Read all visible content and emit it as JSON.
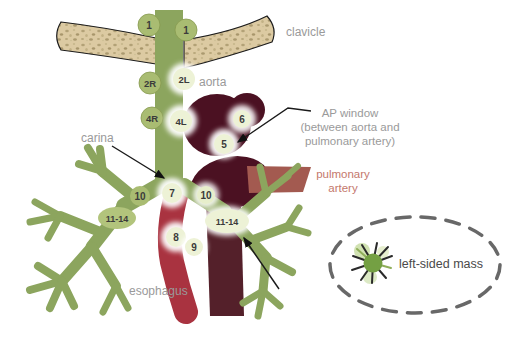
{
  "figure": {
    "labels": {
      "clavicle": "clavicle",
      "aorta": "aorta",
      "ap_window_line1": "AP window",
      "ap_window_line2": "(between aorta and",
      "ap_window_line3": "pulmonary artery)",
      "carina": "carina",
      "pulmonary_artery_line1": "pulmonary",
      "pulmonary_artery_line2": "artery",
      "esophagus": "esophagus",
      "left_sided_mass": "left-sided mass"
    },
    "nodes": [
      {
        "station": "1",
        "position": "right-supraclavicular",
        "highlighted": false
      },
      {
        "station": "1",
        "position": "left-supraclavicular",
        "highlighted": false
      },
      {
        "station": "2R",
        "position": "right-upper-paratracheal",
        "highlighted": false
      },
      {
        "station": "2L",
        "position": "left-upper-paratracheal",
        "highlighted": true
      },
      {
        "station": "4R",
        "position": "right-lower-paratracheal",
        "highlighted": false
      },
      {
        "station": "4L",
        "position": "left-lower-paratracheal",
        "highlighted": true
      },
      {
        "station": "6",
        "position": "para-aortic",
        "highlighted": true
      },
      {
        "station": "5",
        "position": "ap-window",
        "highlighted": true
      },
      {
        "station": "10",
        "position": "right-hilar",
        "highlighted": false
      },
      {
        "station": "7",
        "position": "subcarinal",
        "highlighted": true
      },
      {
        "station": "10",
        "position": "left-hilar",
        "highlighted": true
      },
      {
        "station": "11-14",
        "position": "right-intrapulmonary",
        "highlighted": false
      },
      {
        "station": "11-14",
        "position": "left-intrapulmonary",
        "highlighted": true
      },
      {
        "station": "8",
        "position": "paraesophageal",
        "highlighted": true
      },
      {
        "station": "9",
        "position": "pulmonary-ligament",
        "highlighted": true
      }
    ],
    "colors": {
      "airway_green": "#8ca55e",
      "node_plain_green": "#a9bc72",
      "node_highlight_fill": "#edf2d6",
      "aorta_maroon": "#4b1122",
      "descending_aorta": "#54202a",
      "esophagus_red": "#a93340",
      "pulmonary_artery_brick": "#a35a50",
      "pulmonary_artery_text": "#c4786c",
      "clavicle_tan": "#dccaa2",
      "label_gray": "#9a9a9a",
      "mass_text_gray": "#4a4a4a"
    }
  }
}
